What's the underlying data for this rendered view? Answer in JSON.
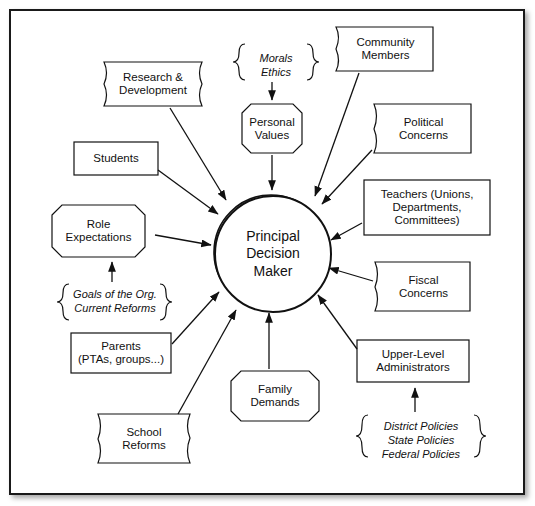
{
  "diagram": {
    "center": {
      "line1": "Principal",
      "line2": "Decision",
      "line3": "Maker"
    },
    "nodes": [
      {
        "id": "morals-ethics",
        "shape": "brace",
        "lines": [
          "Morals",
          "Ethics"
        ]
      },
      {
        "id": "community-members",
        "shape": "flag",
        "lines": [
          "Community",
          "Members"
        ]
      },
      {
        "id": "research-development",
        "shape": "flag",
        "lines": [
          "Research &",
          "Development"
        ]
      },
      {
        "id": "personal-values",
        "shape": "octagon",
        "lines": [
          "Personal",
          "Values"
        ]
      },
      {
        "id": "political-concerns",
        "shape": "flag",
        "lines": [
          "Political",
          "Concerns"
        ]
      },
      {
        "id": "students",
        "shape": "rect",
        "lines": [
          "Students"
        ]
      },
      {
        "id": "teachers",
        "shape": "rect",
        "lines": [
          "Teachers (Unions,",
          "Departments,",
          "Committees)"
        ]
      },
      {
        "id": "role-expectations",
        "shape": "octagon",
        "lines": [
          "Role",
          "Expectations"
        ]
      },
      {
        "id": "fiscal-concerns",
        "shape": "flag",
        "lines": [
          "Fiscal",
          "Concerns"
        ]
      },
      {
        "id": "goals-reforms",
        "shape": "brace",
        "lines": [
          "Goals of the Org.",
          "Current Reforms"
        ]
      },
      {
        "id": "parents",
        "shape": "rect",
        "lines": [
          "Parents",
          "(PTAs, groups...)"
        ]
      },
      {
        "id": "upper-level-administrators",
        "shape": "rect",
        "lines": [
          "Upper-Level",
          "Administrators"
        ]
      },
      {
        "id": "family-demands",
        "shape": "octagon",
        "lines": [
          "Family",
          "Demands"
        ]
      },
      {
        "id": "school-reforms",
        "shape": "flag",
        "lines": [
          "School",
          "Reforms"
        ]
      },
      {
        "id": "policies",
        "shape": "brace",
        "lines": [
          "District Policies",
          "State Policies",
          "Federal Policies"
        ]
      }
    ]
  },
  "colors": {
    "stroke": "#111111",
    "background": "#ffffff",
    "text": "#111111"
  }
}
